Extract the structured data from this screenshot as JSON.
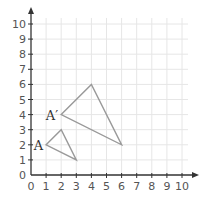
{
  "chart_data": {
    "type": "scatter",
    "title": "",
    "xlabel": "",
    "ylabel": "",
    "xlim": [
      0,
      10
    ],
    "ylim": [
      0,
      10
    ],
    "grid": true,
    "x_ticks": [
      "0",
      "1",
      "2",
      "3",
      "4",
      "5",
      "6",
      "7",
      "8",
      "9",
      "10"
    ],
    "y_ticks": [
      "0",
      "1",
      "2",
      "3",
      "4",
      "5",
      "6",
      "7",
      "8",
      "9",
      "10"
    ],
    "shapes": [
      {
        "name": "triangle",
        "vertices": [
          [
            1,
            2
          ],
          [
            2,
            3
          ],
          [
            3,
            1
          ]
        ],
        "label": "A",
        "label_at": [
          1,
          2
        ]
      },
      {
        "name": "triangle-image",
        "vertices": [
          [
            2,
            4
          ],
          [
            4,
            6
          ],
          [
            6,
            2
          ]
        ],
        "label": "A′",
        "label_at": [
          2,
          4
        ]
      }
    ]
  },
  "labels": {
    "A": "A",
    "A_prime": "A′"
  },
  "colors": {
    "grid": "#e6e6e6",
    "axis": "#333333",
    "shape": "#999999"
  }
}
